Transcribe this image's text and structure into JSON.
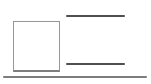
{
  "canvas": {
    "width_px": 151,
    "height_px": 84,
    "background": "#ffffff"
  },
  "shapes": {
    "square_outline": {
      "name": "square-outline-placeholder",
      "fill": "#ffffff",
      "border_color": "#979797",
      "border_bottom_color": "#7e7e7e"
    },
    "rule_top": {
      "name": "horizontal-rule-top",
      "color": "#4f4f4f"
    },
    "rule_middle": {
      "name": "horizontal-rule-middle",
      "color": "#4f4f4f"
    },
    "bottom_divider": {
      "name": "full-width-divider",
      "color": "#7d7d7d"
    }
  }
}
